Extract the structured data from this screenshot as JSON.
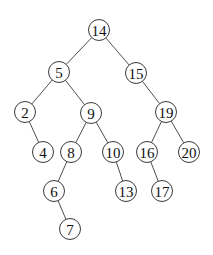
{
  "diagram": {
    "type": "binary-search-tree",
    "node_radius": 10.5,
    "colors": {
      "stroke": "#3a3a3a",
      "fill": "#ffffff",
      "text": "#111111",
      "background": "#ffffff"
    },
    "nodes": [
      {
        "id": "n14",
        "label": "14",
        "x": 99,
        "y": 30
      },
      {
        "id": "n5",
        "label": "5",
        "x": 59,
        "y": 72
      },
      {
        "id": "n15",
        "label": "15",
        "x": 136,
        "y": 73
      },
      {
        "id": "n2",
        "label": "2",
        "x": 25,
        "y": 112
      },
      {
        "id": "n9",
        "label": "9",
        "x": 91,
        "y": 113
      },
      {
        "id": "n19",
        "label": "19",
        "x": 166,
        "y": 112
      },
      {
        "id": "n4",
        "label": "4",
        "x": 43,
        "y": 152
      },
      {
        "id": "n8",
        "label": "8",
        "x": 71,
        "y": 152
      },
      {
        "id": "n10",
        "label": "10",
        "x": 113,
        "y": 152
      },
      {
        "id": "n16",
        "label": "16",
        "x": 147,
        "y": 152
      },
      {
        "id": "n20",
        "label": "20",
        "x": 189,
        "y": 152
      },
      {
        "id": "n6",
        "label": "6",
        "x": 54,
        "y": 191
      },
      {
        "id": "n13",
        "label": "13",
        "x": 126,
        "y": 191
      },
      {
        "id": "n17",
        "label": "17",
        "x": 162,
        "y": 191
      },
      {
        "id": "n7",
        "label": "7",
        "x": 70,
        "y": 229
      }
    ],
    "edges": [
      {
        "from": "n14",
        "to": "n5"
      },
      {
        "from": "n14",
        "to": "n15"
      },
      {
        "from": "n5",
        "to": "n2"
      },
      {
        "from": "n5",
        "to": "n9"
      },
      {
        "from": "n15",
        "to": "n19"
      },
      {
        "from": "n2",
        "to": "n4"
      },
      {
        "from": "n9",
        "to": "n8"
      },
      {
        "from": "n9",
        "to": "n10"
      },
      {
        "from": "n19",
        "to": "n16"
      },
      {
        "from": "n19",
        "to": "n20"
      },
      {
        "from": "n8",
        "to": "n6"
      },
      {
        "from": "n10",
        "to": "n13"
      },
      {
        "from": "n16",
        "to": "n17"
      },
      {
        "from": "n6",
        "to": "n7"
      }
    ]
  }
}
